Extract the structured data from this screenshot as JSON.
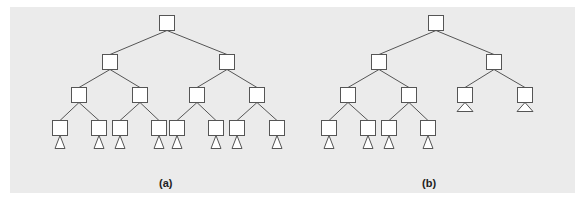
{
  "figure": {
    "background": "#ebebeb",
    "node_fill": "#ffffff",
    "stroke": "#555555",
    "node_size": 15,
    "subtrees": [
      {
        "label": "(a)",
        "label_pos": [
          159,
          177
        ],
        "nodes": [
          {
            "id": "a0",
            "cx": 167,
            "cy": 23
          },
          {
            "id": "a1",
            "cx": 110,
            "cy": 62
          },
          {
            "id": "a2",
            "cx": 227,
            "cy": 62
          },
          {
            "id": "a3",
            "cx": 79,
            "cy": 95
          },
          {
            "id": "a4",
            "cx": 140,
            "cy": 95
          },
          {
            "id": "a5",
            "cx": 197,
            "cy": 95
          },
          {
            "id": "a6",
            "cx": 257,
            "cy": 95
          },
          {
            "id": "a7",
            "cx": 60,
            "cy": 128
          },
          {
            "id": "a8",
            "cx": 99,
            "cy": 128
          },
          {
            "id": "a9",
            "cx": 120,
            "cy": 128
          },
          {
            "id": "a10",
            "cx": 159,
            "cy": 128
          },
          {
            "id": "a11",
            "cx": 177,
            "cy": 128
          },
          {
            "id": "a12",
            "cx": 216,
            "cy": 128
          },
          {
            "id": "a13",
            "cx": 237,
            "cy": 128
          },
          {
            "id": "a14",
            "cx": 277,
            "cy": 128
          }
        ],
        "edges": [
          [
            "a0",
            "a1"
          ],
          [
            "a0",
            "a2"
          ],
          [
            "a1",
            "a3"
          ],
          [
            "a1",
            "a4"
          ],
          [
            "a2",
            "a5"
          ],
          [
            "a2",
            "a6"
          ],
          [
            "a3",
            "a7"
          ],
          [
            "a3",
            "a8"
          ],
          [
            "a4",
            "a9"
          ],
          [
            "a4",
            "a10"
          ],
          [
            "a5",
            "a11"
          ],
          [
            "a5",
            "a12"
          ],
          [
            "a6",
            "a13"
          ],
          [
            "a6",
            "a14"
          ]
        ],
        "triangles": [
          {
            "under": "a7",
            "w": 10,
            "h": 13
          },
          {
            "under": "a8",
            "w": 10,
            "h": 13
          },
          {
            "under": "a9",
            "w": 10,
            "h": 13
          },
          {
            "under": "a10",
            "w": 10,
            "h": 13
          },
          {
            "under": "a11",
            "w": 10,
            "h": 13
          },
          {
            "under": "a12",
            "w": 10,
            "h": 13
          },
          {
            "under": "a13",
            "w": 10,
            "h": 13
          },
          {
            "under": "a14",
            "w": 10,
            "h": 13
          }
        ]
      },
      {
        "label": "(b)",
        "label_pos": [
          422,
          177
        ],
        "nodes": [
          {
            "id": "b0",
            "cx": 436,
            "cy": 23
          },
          {
            "id": "b1",
            "cx": 379,
            "cy": 62
          },
          {
            "id": "b2",
            "cx": 494,
            "cy": 62
          },
          {
            "id": "b3",
            "cx": 348,
            "cy": 95
          },
          {
            "id": "b4",
            "cx": 409,
            "cy": 95
          },
          {
            "id": "b5",
            "cx": 465,
            "cy": 95
          },
          {
            "id": "b6",
            "cx": 525,
            "cy": 95
          },
          {
            "id": "b7",
            "cx": 329,
            "cy": 128
          },
          {
            "id": "b8",
            "cx": 368,
            "cy": 128
          },
          {
            "id": "b9",
            "cx": 389,
            "cy": 128
          },
          {
            "id": "b10",
            "cx": 428,
            "cy": 128
          }
        ],
        "edges": [
          [
            "b0",
            "b1"
          ],
          [
            "b0",
            "b2"
          ],
          [
            "b1",
            "b3"
          ],
          [
            "b1",
            "b4"
          ],
          [
            "b2",
            "b5"
          ],
          [
            "b2",
            "b6"
          ],
          [
            "b3",
            "b7"
          ],
          [
            "b3",
            "b8"
          ],
          [
            "b4",
            "b9"
          ],
          [
            "b4",
            "b10"
          ]
        ],
        "triangles": [
          {
            "under": "b5",
            "w": 16,
            "h": 9
          },
          {
            "under": "b6",
            "w": 16,
            "h": 9
          },
          {
            "under": "b7",
            "w": 10,
            "h": 13
          },
          {
            "under": "b8",
            "w": 10,
            "h": 13
          },
          {
            "under": "b9",
            "w": 10,
            "h": 13
          },
          {
            "under": "b10",
            "w": 10,
            "h": 13
          }
        ]
      }
    ]
  }
}
